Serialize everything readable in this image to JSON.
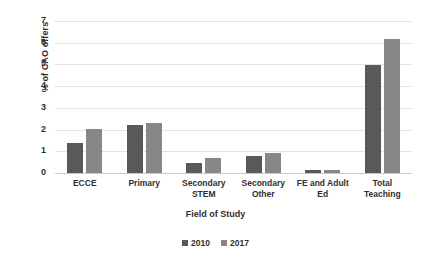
{
  "chart_data": {
    "type": "bar",
    "title": "",
    "xlabel": "Field of Study",
    "ylabel": "% of CAO offers",
    "categories": [
      "ECCE",
      "Primary",
      "Secondary STEM",
      "Secondary Other",
      "FE and Adult Ed",
      "Total Teaching"
    ],
    "category_lines": [
      [
        "ECCE"
      ],
      [
        "Primary"
      ],
      [
        "Secondary",
        "STEM"
      ],
      [
        "Secondary",
        "Other"
      ],
      [
        "FE and Adult",
        "Ed"
      ],
      [
        "Total",
        "Teaching"
      ]
    ],
    "series": [
      {
        "name": "2010",
        "color": "#595959",
        "values": [
          1.4,
          2.2,
          0.45,
          0.8,
          0.13,
          4.97
        ]
      },
      {
        "name": "2017",
        "color": "#878787",
        "values": [
          2.05,
          2.3,
          0.68,
          0.9,
          0.13,
          6.15
        ]
      }
    ],
    "ylim": [
      0,
      7
    ],
    "yticks": [
      0,
      1,
      2,
      3,
      4,
      5,
      6,
      7
    ],
    "ytick_labels": [
      "0",
      "1",
      "2",
      "3",
      "4",
      "5",
      "6",
      "7"
    ],
    "grid": true,
    "legend_position": "bottom"
  },
  "legend": {
    "entries": [
      {
        "label": "2010"
      },
      {
        "label": "2017"
      }
    ]
  },
  "colors": {
    "series_2010": "#595959",
    "series_2017": "#878787",
    "gridline": "#e2e2e2",
    "text": "#2f2f2f",
    "background": "#ffffff"
  }
}
